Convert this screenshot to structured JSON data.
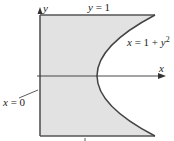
{
  "diagram": {
    "type": "region-plot",
    "axes": {
      "x_label": "x",
      "y_label": "y"
    },
    "boundaries": {
      "top_label": "y = 1",
      "curve_label_prefix": "x = 1 + y",
      "curve_label_exponent": "2",
      "left_label": "x = 0"
    },
    "tick_mark": "'",
    "colors": {
      "fill": "#e2e2e2",
      "stroke": "#555555",
      "axis": "#333333",
      "text": "#222222"
    }
  }
}
